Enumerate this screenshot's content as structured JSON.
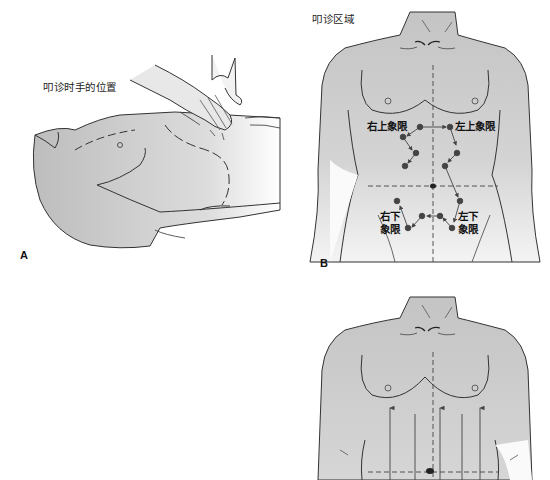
{
  "panel_a": {
    "letter": "A",
    "caption": "叩诊时手的位置"
  },
  "panel_b": {
    "letter": "B",
    "title": "叩诊区域",
    "quadrants": {
      "right_upper": "右上象限",
      "left_upper": "左上象限",
      "right_lower_line1": "右下",
      "right_lower_line2": "象限",
      "left_lower_line1": "左下",
      "left_lower_line2": "象限"
    }
  },
  "panel_c": {
    "arrow_count": 5
  },
  "colors": {
    "skin_gray": "#c8c8c8",
    "outline": "#333333",
    "dot": "#444444",
    "background": "#ffffff"
  }
}
